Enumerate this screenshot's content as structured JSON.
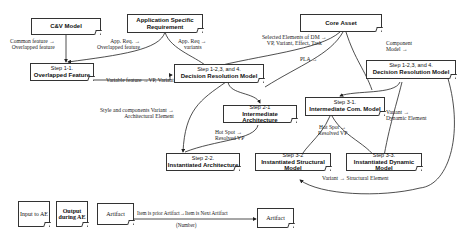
{
  "nodes": {
    "cv_model": "C&V Model",
    "app_req": [
      "Application Specific",
      "Requirement"
    ],
    "core_asset": "Core Asset",
    "step11": [
      "Step 1-1.",
      "Overlapped Feature"
    ],
    "dr_model_left": [
      "Step 1-2,3, and 4.",
      "Decision Resolution Model"
    ],
    "dr_model_right": [
      "Step 1-2,3, and 4.",
      "Decision Resolution Model"
    ],
    "step21": [
      "Step 2-1",
      "Intermediate Architecture"
    ],
    "step22": [
      "Step 2-2.",
      "Instantiated Architecture"
    ],
    "step31": [
      "Step 3-1.",
      "Intermediate Com. Model"
    ],
    "step32": [
      "Step 3-2",
      "Instantiated Structural Model"
    ],
    "step33": [
      "Step 3-3.",
      "Instantiated Dynamic Model"
    ]
  },
  "edge_labels": {
    "common_feature": [
      "Common feature →",
      "Overlapped feature"
    ],
    "app_req_overlapped": [
      "App. Req. →",
      "Overlapped feature"
    ],
    "app_req_variants": [
      "App. Req →",
      "variants"
    ],
    "selected_elements": [
      "Selected Elements of DM →",
      "VP, Variant, Effect, Task"
    ],
    "component_model": [
      "Component",
      "Model →"
    ],
    "pla": "PLA →",
    "variable_feature": "Variable feature →VP, Variant",
    "style_components": [
      "Style and components Variant →",
      "Architectural Element"
    ],
    "hot_spot_left": [
      "Hot Spot →",
      "Resolved VP"
    ],
    "hot_spot_right": [
      "Hot Spot →",
      "Resolved VP"
    ],
    "variant_dynamic": [
      "Variant →",
      "Dynamic Element"
    ],
    "variant_structural": "Variant → Structural Element"
  },
  "legend": {
    "input": "Input to AE",
    "output": [
      "Output",
      "during AE"
    ],
    "artifact_left": "Artifact",
    "edge_text": "Item is prior Artifact→Item is Next Artifact",
    "edge_number": "(Number)",
    "artifact_right": "Artifact"
  }
}
